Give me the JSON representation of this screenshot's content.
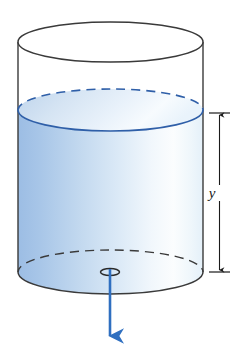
{
  "figure": {
    "kind": "physics-diagram",
    "background_color": "#ffffff"
  },
  "tank": {
    "name": "cylinder",
    "left_x": 18,
    "right_x": 203,
    "top_ellipse": {
      "cx": 110.5,
      "cy": 42,
      "rx": 92.5,
      "ry": 20
    },
    "bottom_ellipse": {
      "cx": 110.5,
      "cy": 272,
      "rx": 92.5,
      "ry": 22
    },
    "outline_color": "#3a3a3a",
    "outline_width": 1.4
  },
  "water": {
    "name": "water-body",
    "surface_ellipse": {
      "cx": 110.5,
      "cy": 110,
      "rx": 92.5,
      "ry": 21
    },
    "surface_outline_color": "#2f5fa8",
    "surface_back_dashed": true,
    "surface_front_solid": true,
    "fill_stops": [
      {
        "offset": "0%",
        "color": "#9cbde4"
      },
      {
        "offset": "12%",
        "color": "#a8c6e8"
      },
      {
        "offset": "34%",
        "color": "#c3d9ef"
      },
      {
        "offset": "55%",
        "color": "#dceaf7"
      },
      {
        "offset": "72%",
        "color": "#f1f7fc"
      },
      {
        "offset": "84%",
        "color": "#fbfdfe"
      },
      {
        "offset": "94%",
        "color": "#eef6fb"
      },
      {
        "offset": "100%",
        "color": "#e4f0f9"
      }
    ],
    "top_face_stops": [
      {
        "offset": "0%",
        "color": "#bed4ec"
      },
      {
        "offset": "30%",
        "color": "#d5e4f3"
      },
      {
        "offset": "60%",
        "color": "#e8f1fa"
      },
      {
        "offset": "82%",
        "color": "#f7fbfe"
      },
      {
        "offset": "100%",
        "color": "#e9f3fb"
      }
    ]
  },
  "drain": {
    "name": "drain-hole",
    "cx": 110,
    "cy": 272,
    "rx": 9.5,
    "ry": 3.5,
    "color": "#2a2a2a"
  },
  "flow_arrow": {
    "name": "outflow-arrow",
    "x": 110,
    "y_start": 271,
    "y_end": 341,
    "color": "#2f6fc0",
    "stroke_width": 2.6,
    "direction": "down"
  },
  "dimension": {
    "name": "height-dimension",
    "label": "y",
    "label_x": 212,
    "label_y": 195,
    "line_x": 219,
    "top_y": 113,
    "bottom_y": 272,
    "tick_half_width": 10,
    "color": "#1a1a1a",
    "stroke_width": 1.2,
    "measures": "depth of water above the drain hole"
  }
}
